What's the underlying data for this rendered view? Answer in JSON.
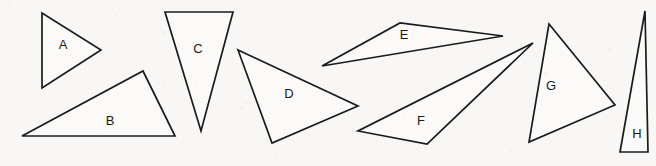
{
  "figure": {
    "background_color": "#f8f7f5",
    "stroke_color": "#1b1b1b",
    "fill_color": "#fbfaf8",
    "width": 656,
    "height": 166
  },
  "chart_data": {
    "type": "diagram",
    "xlabel": "",
    "ylabel": "",
    "xlim": [
      0,
      656
    ],
    "ylim": [
      0,
      166
    ],
    "grid": false,
    "legend": "none",
    "shape_type": "triangle",
    "count": 8,
    "shapes": [
      {
        "label": "A",
        "points": "42,13 42,88 101,50",
        "label_x": 63,
        "label_y": 46,
        "description": "isosceles triangle pointing right"
      },
      {
        "label": "B",
        "points": "22,136 143,71 175,136",
        "label_x": 110,
        "label_y": 122,
        "description": "obtuse scalene triangle, wide flat base"
      },
      {
        "label": "C",
        "points": "165,12 233,12 201,131",
        "label_x": 198,
        "label_y": 50,
        "description": "tall narrow triangle pointing down"
      },
      {
        "label": "D",
        "points": "238,50 358,106 272,143",
        "label_x": 289,
        "label_y": 95,
        "description": "scalene triangle tilted right"
      },
      {
        "label": "E",
        "points": "322,66 400,23 503,36",
        "label_x": 404,
        "label_y": 36,
        "description": "very thin sliver triangle"
      },
      {
        "label": "F",
        "points": "533,43 358,131 427,144",
        "label_x": 421,
        "label_y": 122,
        "description": "long thin sliver triangle pointing right"
      },
      {
        "label": "G",
        "points": "549,24 615,105 529,142",
        "label_x": 551,
        "label_y": 87,
        "description": "large near-equilateral triangle"
      },
      {
        "label": "H",
        "points": "645,11 648,152 620,152",
        "label_x": 637,
        "label_y": 135,
        "description": "tall narrow right triangle"
      }
    ]
  }
}
